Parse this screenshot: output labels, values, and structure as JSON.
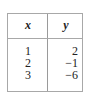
{
  "table": {
    "headers": [
      "x",
      "y"
    ],
    "rows": [
      {
        "x": "1",
        "y": "2"
      },
      {
        "x": "2",
        "y": "−1"
      },
      {
        "x": "3",
        "y": "−6"
      }
    ]
  }
}
